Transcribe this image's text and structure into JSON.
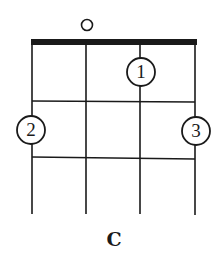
{
  "chord": {
    "name": "C",
    "instrument_strings": 4,
    "frets_shown": 3,
    "open_strings": [
      2
    ],
    "fingers": [
      {
        "label": "1",
        "string": 3,
        "fret": 1
      },
      {
        "label": "2",
        "string": 1,
        "fret": 2
      },
      {
        "label": "3",
        "string": 4,
        "fret": 2
      }
    ]
  },
  "colors": {
    "line": "#1a1a1a",
    "background": "#ffffff"
  }
}
